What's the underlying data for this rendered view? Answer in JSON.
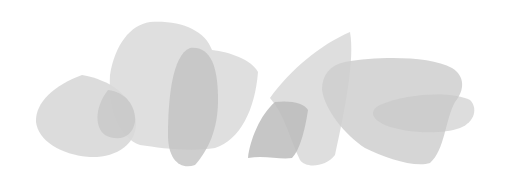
{
  "canvas": {
    "width": 509,
    "height": 178,
    "background": "#ffffff"
  },
  "colors": {
    "light": "#d9d9d9",
    "mid": "#c8c8c8",
    "dark": "#b8b8b8"
  },
  "shapes": [
    {
      "name": "left-teardrop",
      "d": "M82,75 C110,80 132,95 136,120 C138,145 115,158 90,157 C60,155 38,140 36,122 C35,102 55,85 82,75 Z",
      "fill": "#d6d6d6",
      "opacity": 0.85
    },
    {
      "name": "large-center-blob",
      "d": "M150,22 C180,20 205,30 212,50 C230,52 252,60 258,72 C255,110 240,140 215,148 C190,152 160,148 140,145 C120,138 108,110 110,75 C115,45 130,25 150,22 Z",
      "fill": "#d9d9d9",
      "opacity": 0.85
    },
    {
      "name": "overlap-left-oval",
      "d": "M108,90 C125,92 136,105 135,122 C132,138 118,142 105,135 C95,128 94,108 108,90 Z",
      "fill": "#c4c4c4",
      "opacity": 0.7
    },
    {
      "name": "tall-dark-oval",
      "d": "M190,48 C210,46 218,65 218,100 C218,130 208,150 195,165 C180,170 168,160 168,135 C168,100 172,55 190,48 Z",
      "fill": "#c2c2c2",
      "opacity": 0.8
    },
    {
      "name": "center-wedge",
      "d": "M350,32 C355,60 345,110 335,155 C325,168 305,168 300,160 C290,140 285,115 270,98 C290,70 320,45 350,32 Z",
      "fill": "#d8d8d8",
      "opacity": 0.85
    },
    {
      "name": "small-dark-polygon",
      "d": "M275,102 C290,100 305,103 308,110 C305,130 300,150 292,158 C280,160 265,155 248,158 C250,140 260,115 275,102 Z",
      "fill": "#bcbcbc",
      "opacity": 0.85
    },
    {
      "name": "right-rounded-triangle",
      "d": "M345,62 C380,56 430,56 452,68 C465,76 465,90 455,102 C445,120 445,150 430,163 C415,168 385,158 365,148 C345,135 325,110 322,90 C322,75 330,65 345,62 Z",
      "fill": "#cfcfcf",
      "opacity": 0.85
    },
    {
      "name": "right-inner-lens",
      "d": "M380,105 C410,92 455,92 470,100 C478,108 475,122 460,128 C440,135 405,133 385,125 C370,118 370,110 380,105 Z",
      "fill": "#c6c6c6",
      "opacity": 0.6
    }
  ]
}
